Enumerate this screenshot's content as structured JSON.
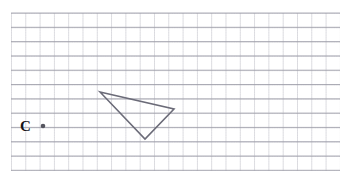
{
  "figure": {
    "kind": "geometry-grid-figure",
    "background_color": "#ffffff",
    "canvas": {
      "width": 343,
      "height": 181
    }
  },
  "grid": {
    "name": "graph-paper-grid",
    "origin_x": 11,
    "origin_y": 13,
    "cell_size": 14.3,
    "columns": 23,
    "rows": 11,
    "line_color_major": "#9a9aa6",
    "line_color_minor": "#d8d8e0",
    "line_width": 0.8,
    "dash_pattern": "1 1"
  },
  "shapes": {
    "triangle": {
      "name": "triangle",
      "stroke_color": "#6b6b78",
      "stroke_width": 1.5,
      "fill": "none",
      "vertices": [
        {
          "name": "vertex-top-left",
          "x": 100,
          "y": 92
        },
        {
          "name": "vertex-right",
          "x": 174,
          "y": 109
        },
        {
          "name": "vertex-bottom",
          "x": 145,
          "y": 139
        }
      ],
      "points_attr": "100,92 174,109 145,139"
    }
  },
  "points": [
    {
      "name": "center-point-c",
      "label": "C",
      "x": 43,
      "y": 126,
      "radius": 2.3,
      "color": "#55555f",
      "label_x": 24,
      "label_y": 126,
      "label_color": "#141418"
    }
  ]
}
